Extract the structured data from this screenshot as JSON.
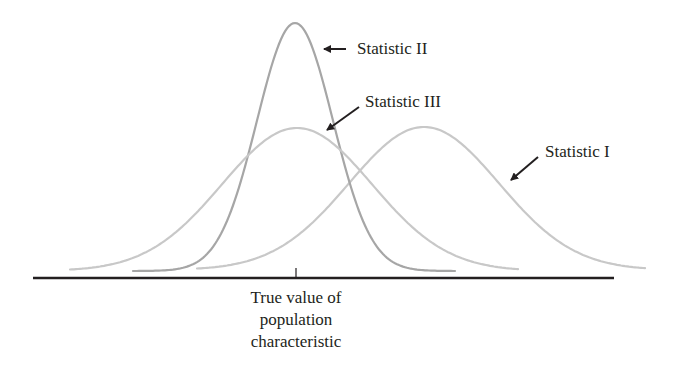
{
  "diagram": {
    "colors": {
      "curve_light": "#c8c8c8",
      "curve_dark": "#a6a6a6",
      "axis": "#231f20",
      "arrow": "#231f20",
      "text": "#231f20"
    },
    "curves": [
      {
        "name": "Statistic I",
        "center_x": 424,
        "peak_y": 127,
        "left_x": 197,
        "right_x": 646,
        "end_y": 264,
        "sigma": 75,
        "color_key": "curve_light"
      },
      {
        "name": "Statistic II",
        "center_x": 295,
        "peak_y": 23,
        "left_x": 133,
        "right_x": 455,
        "end_y": 265,
        "sigma": 38,
        "color_key": "curve_dark"
      },
      {
        "name": "Statistic III",
        "center_x": 297,
        "peak_y": 128,
        "left_x": 70,
        "right_x": 518,
        "end_y": 265,
        "sigma": 75,
        "color_key": "curve_light"
      }
    ],
    "labels": {
      "statistic_1": "Statistic I",
      "statistic_2": "Statistic II",
      "statistic_3": "Statistic III"
    },
    "axis": {
      "x_start": 33,
      "x_end": 614,
      "y": 278,
      "tick_x": 296,
      "caption_lines": [
        "True value of",
        "population",
        "characteristic"
      ]
    }
  }
}
